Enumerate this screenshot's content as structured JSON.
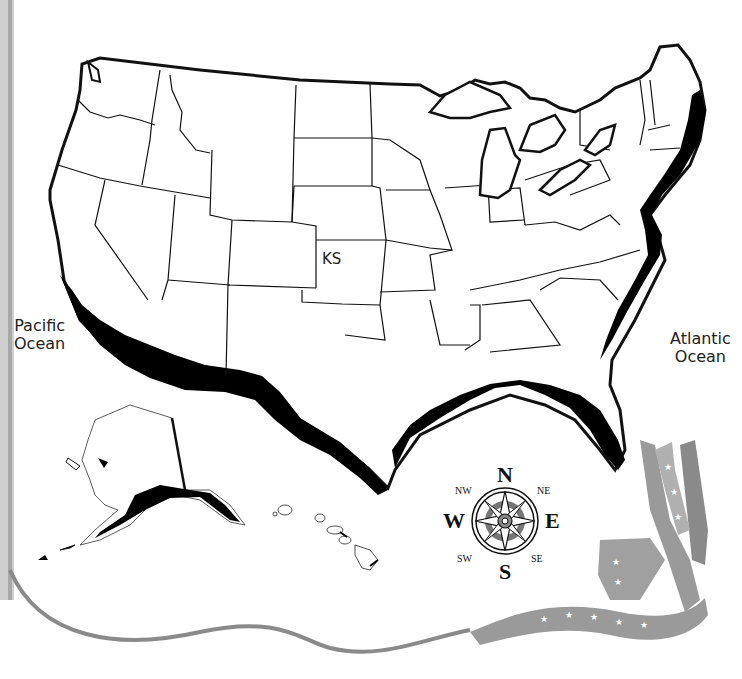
{
  "map": {
    "title": "United States coastal regions map",
    "labels": {
      "pacific": "Pacific Ocean",
      "pacific_line1": "Pacific",
      "pacific_line2": "Ocean",
      "atlantic_line1": "Atlantic",
      "atlantic_line2": "Ocean",
      "state_label": "KS"
    },
    "highlighted": "Coastal regions (shaded black) along Pacific, Gulf and Atlantic coasts",
    "insets": [
      "Alaska",
      "Hawaii"
    ]
  },
  "compass": {
    "n": "N",
    "s": "S",
    "e": "E",
    "w": "W",
    "ne": "NE",
    "nw": "NW",
    "se": "SE",
    "sw": "SW"
  },
  "colors": {
    "outline": "#111111",
    "coast_fill": "#000000",
    "land_fill": "#ffffff",
    "ribbon": "#8c8c8c",
    "ribbon_light": "#b5b5b5",
    "compass_center": "#808080"
  }
}
